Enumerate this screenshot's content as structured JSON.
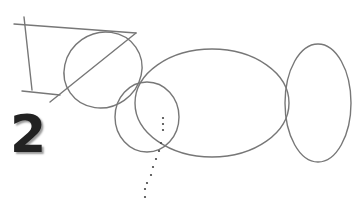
{
  "step_number": "2",
  "stroke_color": "#7a7a7a"
}
